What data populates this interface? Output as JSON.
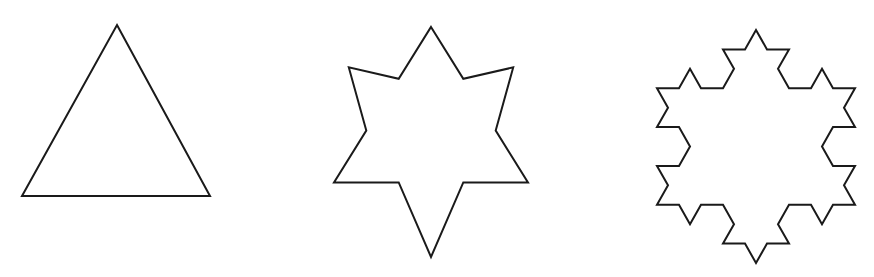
{
  "diagram": {
    "title": "",
    "background": "#ffffff",
    "stroke_color": "#1a1a1a",
    "figures": [
      {
        "id": "koch-iteration-0",
        "label": "",
        "kind": "equilateral triangle",
        "iterations": 0,
        "triangle": [
          [
            117,
            25
          ],
          [
            210,
            196
          ],
          [
            22,
            196
          ]
        ]
      },
      {
        "id": "koch-iteration-1",
        "label": "",
        "kind": "six-pointed star",
        "iterations": 1,
        "triangle": [
          [
            432,
            87
          ],
          [
            526,
            200
          ],
          [
            338,
            200
          ]
        ],
        "fit_bbox": [
          334,
          27,
          528,
          257
        ]
      },
      {
        "id": "koch-iteration-2",
        "label": "",
        "kind": "Koch snowflake (2nd iteration)",
        "iterations": 2,
        "fit_bbox": [
          657,
          30,
          855,
          263
        ]
      }
    ]
  }
}
